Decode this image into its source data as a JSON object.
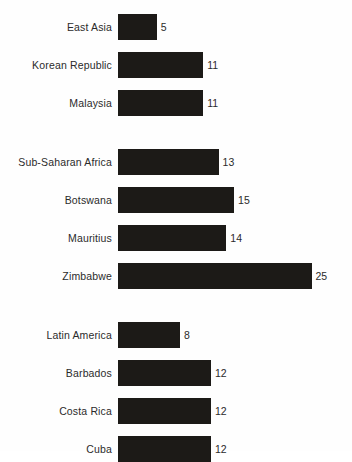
{
  "chart_data": {
    "type": "bar",
    "orientation": "horizontal",
    "title": "",
    "subtitle": "",
    "xlabel": "",
    "ylabel": "",
    "xlim": [
      0,
      25
    ],
    "grid": false,
    "legend": null,
    "bar_color": "#1c1a17",
    "background_color": "#fefefe",
    "label_color": "#2b2b2b",
    "value_labels_shown": true,
    "groups": [
      {
        "name": "East Asia group",
        "categories": [
          "East Asia",
          "Korean Republic",
          "Malaysia"
        ],
        "values": [
          5,
          11,
          11
        ]
      },
      {
        "name": "Sub-Saharan Africa group",
        "categories": [
          "Sub-Saharan Africa",
          "Botswana",
          "Mauritius",
          "Zimbabwe"
        ],
        "values": [
          13,
          15,
          14,
          25
        ]
      },
      {
        "name": "Latin America group",
        "categories": [
          "Latin America",
          "Barbados",
          "Costa Rica",
          "Cuba"
        ],
        "values": [
          8,
          12,
          12,
          12
        ]
      }
    ],
    "categories": [
      "East Asia",
      "Korean Republic",
      "Malaysia",
      "Sub-Saharan Africa",
      "Botswana",
      "Mauritius",
      "Zimbabwe",
      "Latin America",
      "Barbados",
      "Costa Rica",
      "Cuba"
    ],
    "values": [
      5,
      11,
      11,
      13,
      15,
      14,
      25,
      8,
      12,
      12,
      12
    ]
  }
}
